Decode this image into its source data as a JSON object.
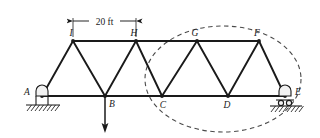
{
  "figure": {
    "type": "truss-free-body-diagram",
    "background_color": "#ffffff",
    "line_color": "#1a1a1a",
    "section_cut_color": "#4a4a4a"
  },
  "dimension": {
    "label": "20 ft",
    "from_node": "I",
    "to_node": "H"
  },
  "nodes": [
    {
      "id": "A",
      "label": "A",
      "x": 42,
      "y": 96,
      "label_x": 27,
      "label_y": 95,
      "chord": "bottom"
    },
    {
      "id": "B",
      "label": "B",
      "x": 105,
      "y": 96,
      "label_x": 110,
      "label_y": 107,
      "chord": "bottom"
    },
    {
      "id": "C",
      "label": "C",
      "x": 162,
      "y": 96,
      "label_x": 162,
      "label_y": 108,
      "chord": "bottom"
    },
    {
      "id": "D",
      "label": "D",
      "x": 228,
      "y": 96,
      "label_x": 225,
      "label_y": 108,
      "chord": "bottom"
    },
    {
      "id": "E",
      "label": "E",
      "x": 285,
      "y": 96,
      "label_x": 297,
      "label_y": 95,
      "chord": "bottom"
    },
    {
      "id": "I",
      "label": "I",
      "x": 73,
      "y": 41,
      "label_x": 70,
      "label_y": 35,
      "chord": "top"
    },
    {
      "id": "H",
      "label": "H",
      "x": 136,
      "y": 41,
      "label_x": 133,
      "label_y": 35,
      "chord": "top"
    },
    {
      "id": "G",
      "label": "G",
      "x": 197,
      "y": 41,
      "label_x": 194,
      "label_y": 35,
      "chord": "top"
    },
    {
      "id": "F",
      "label": "F",
      "x": 259,
      "y": 41,
      "label_x": 256,
      "label_y": 35,
      "chord": "top"
    }
  ],
  "members": {
    "bottom_chord": [
      [
        "A",
        "B"
      ],
      [
        "B",
        "C"
      ],
      [
        "C",
        "D"
      ],
      [
        "D",
        "E"
      ]
    ],
    "top_chord": [
      [
        "I",
        "H"
      ],
      [
        "H",
        "G"
      ],
      [
        "G",
        "F"
      ]
    ],
    "diagonals": [
      [
        "A",
        "I"
      ],
      [
        "I",
        "B"
      ],
      [
        "B",
        "H"
      ],
      [
        "H",
        "C"
      ],
      [
        "C",
        "G"
      ],
      [
        "G",
        "D"
      ],
      [
        "D",
        "F"
      ],
      [
        "F",
        "E"
      ]
    ]
  },
  "supports": [
    {
      "at_node": "A",
      "kind": "pin-support",
      "name": "pin-support-a"
    },
    {
      "at_node": "E",
      "kind": "roller-support",
      "name": "roller-support-e"
    }
  ],
  "loads": [
    {
      "at_node": "B",
      "direction": "down",
      "label": "",
      "length": 36
    }
  ],
  "section_cut": {
    "shape": "ellipse",
    "center_x": 223,
    "center_y": 79,
    "radius_x": 78,
    "radius_y": 53,
    "encloses": [
      "C",
      "D",
      "E",
      "G",
      "F"
    ]
  }
}
